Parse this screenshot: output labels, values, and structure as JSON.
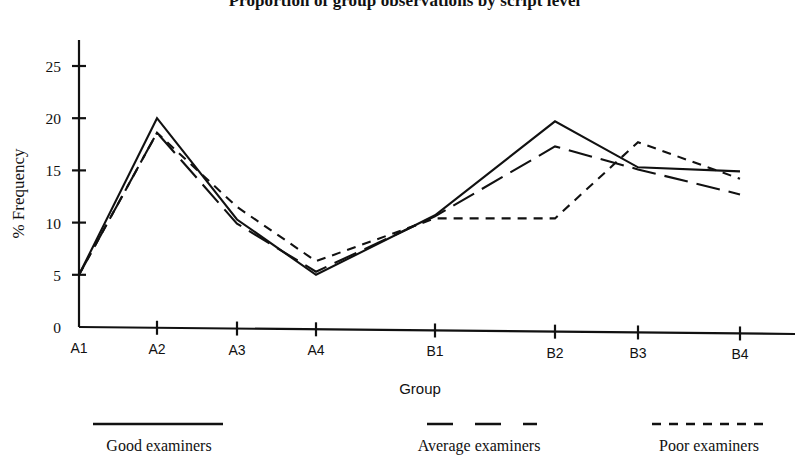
{
  "chart_data": {
    "type": "line",
    "title": "Proportion of group observations by script level",
    "xlabel": "Group",
    "ylabel": "% Frequency",
    "categories": [
      "A1",
      "A2",
      "A3",
      "A4",
      "B1",
      "B2",
      "B3",
      "B4"
    ],
    "yticks": [
      0,
      5,
      10,
      15,
      20,
      25
    ],
    "ylim": [
      0,
      28
    ],
    "grid": false,
    "legend_position": "bottom",
    "series": [
      {
        "name": "Good examiners",
        "style": "solid",
        "values": [
          5.0,
          20.0,
          10.3,
          5.0,
          10.7,
          19.7,
          15.3,
          14.9
        ]
      },
      {
        "name": "Average examiners",
        "style": "long-dash",
        "values": [
          5.0,
          18.6,
          9.9,
          5.3,
          10.6,
          17.3,
          15.1,
          12.7
        ]
      },
      {
        "name": "Poor examiners",
        "style": "short-dash",
        "values": [
          5.0,
          18.6,
          11.5,
          6.3,
          10.4,
          10.4,
          17.7,
          14.2
        ]
      }
    ]
  },
  "legend": {
    "items": [
      {
        "label": "Good examiners",
        "style": "solid"
      },
      {
        "label": "Average examiners",
        "style": "long-dash"
      },
      {
        "label": "Poor examiners",
        "style": "short-dash"
      }
    ]
  }
}
